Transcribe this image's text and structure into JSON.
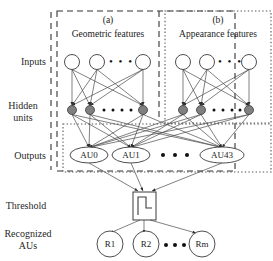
{
  "figure": {
    "type": "neural-network-architecture-diagram"
  },
  "row_labels": [
    {
      "id": "inputs",
      "text": "Inputs"
    },
    {
      "id": "hidden-units-line1",
      "text": "Hidden"
    },
    {
      "id": "hidden-units-line2",
      "text": "units"
    },
    {
      "id": "outputs",
      "text": "Outputs"
    },
    {
      "id": "threshold",
      "text": "Threshold"
    },
    {
      "id": "recognized-line1",
      "text": "Recognized"
    },
    {
      "id": "recognized-line2",
      "text": "AUs"
    }
  ],
  "panels": [
    {
      "id": "a",
      "tag": "(a)",
      "caption": "Geometric features",
      "border": "dashed"
    },
    {
      "id": "b",
      "tag": "(b)",
      "caption": "Appearance features",
      "border": "dotted"
    }
  ],
  "ellipsis": {
    "symbol": "• • •"
  },
  "layers": {
    "input": {
      "name": "Inputs",
      "node_shape": "circle-open",
      "nodes_per_panel": 3,
      "ellipsis_between": true
    },
    "hidden": {
      "name": "Hidden units",
      "node_shape": "circle-filled-gray",
      "fill": "#808080",
      "nodes_per_panel": 3,
      "ellipsis_between": true
    },
    "output": {
      "name": "Outputs",
      "node_shape": "ellipse-open",
      "labels": [
        "AU0",
        "AU1",
        "AU43"
      ],
      "ellipsis_between": true,
      "border": "dotted"
    },
    "threshold": {
      "name": "Threshold",
      "node_shape": "box-with-step-function",
      "symbol": "step"
    },
    "recognized": {
      "name": "Recognized AUs",
      "node_shape": "circle-open",
      "labels": [
        "R1",
        "R2",
        "Rm"
      ],
      "ellipsis_between": true
    }
  },
  "colors": {
    "stroke": "#3a3a3a",
    "hidden_fill": "#808080",
    "text": "#1a1a1a",
    "background": "#ffffff"
  }
}
